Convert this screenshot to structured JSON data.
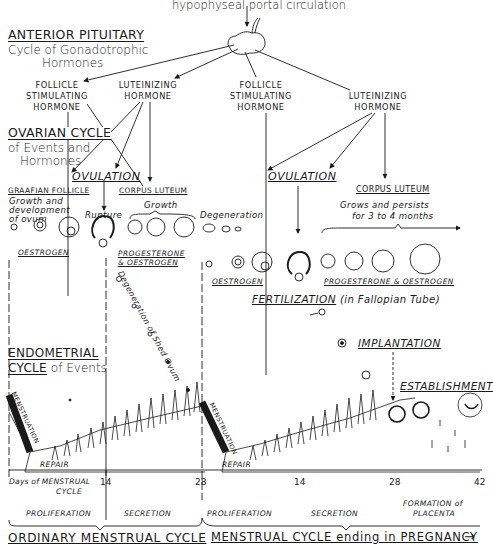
{
  "header": {
    "portal": "hypophyseal portal circulation"
  },
  "pituitary": {
    "title": "ANTERIOR PITUITARY",
    "subtitle_line1": "Cycle of Gonadotrophic",
    "subtitle_line2": "Hormones",
    "hormones": [
      {
        "line1": "FOLLICLE",
        "line2": "STIMULATING",
        "line3": "HORMONE"
      },
      {
        "line1": "LUTEINIZING",
        "line2": "HORMONE"
      },
      {
        "line1": "FOLLICLE",
        "line2": "STIMULATING",
        "line3": "HORMONE"
      },
      {
        "line1": "LUTEINIZING",
        "line2": "HORMONE"
      }
    ]
  },
  "ovarian": {
    "title": "OVARIAN CYCLE",
    "subtitle_line1": "of Events and",
    "subtitle_line2": "Hormones",
    "ovulation_left": "OVULATION",
    "ovulation_right": "OVULATION",
    "graafian": "GRAAFIAN FOLLICLE",
    "graafian_note_line1": "Growth and",
    "graafian_note_line2": "development",
    "graafian_note_line3": "of ovum",
    "rupture": "Rupture",
    "corpus_luteum_left": "CORPUS LUTEUM",
    "growth": "Growth",
    "degeneration": "Degeneration",
    "corpus_luteum_right": "CORPUS LUTEUM",
    "persist_line1": "Grows and persists",
    "persist_line2": "for 3 to 4 months",
    "oestrogen_left": "OESTROGEN",
    "prog_left_line1": "PROGESTERONE",
    "prog_left_line2": "& OESTROGEN",
    "oestrogen_right": "OESTROGEN",
    "prog_right": "PROGESTERONE & OESTROGEN",
    "shed_ovum": "Degeneration of Shed Ovum",
    "fertilization": "FERTILIZATION",
    "fertilization_note": "(in Fallopian Tube)",
    "implantation": "IMPLANTATION",
    "establishment": "ESTABLISHMENT"
  },
  "endometrial": {
    "title": "ENDOMETRIAL",
    "title2": "CYCLE",
    "title2_suffix": "of Events",
    "menstruation_1": "MENSTRUATION",
    "menstruation_2": "MENSTRUATION",
    "repair_1": "REPAIR",
    "repair_2": "REPAIR"
  },
  "axis": {
    "label_line1": "Days of MENSTRUAL",
    "label_line2": "CYCLE",
    "ticks": [
      "14",
      "28",
      "14",
      "28",
      "42"
    ]
  },
  "phases": {
    "proliferation_1": "PROLIFERATION",
    "secretion_1": "SECRETION",
    "proliferation_2": "PROLIFERATION",
    "secretion_2": "SECRETION",
    "placenta_line1": "FORMATION of",
    "placenta_line2": "PLACENTA"
  },
  "footer": {
    "ordinary": "ORDINARY MENSTRUAL CYCLE",
    "pregnancy": "MENSTRUAL CYCLE ending in PREGNANCY",
    "arrow": "→"
  },
  "colors": {
    "ink": "#1a1a1a",
    "paper": "#ffffff"
  }
}
